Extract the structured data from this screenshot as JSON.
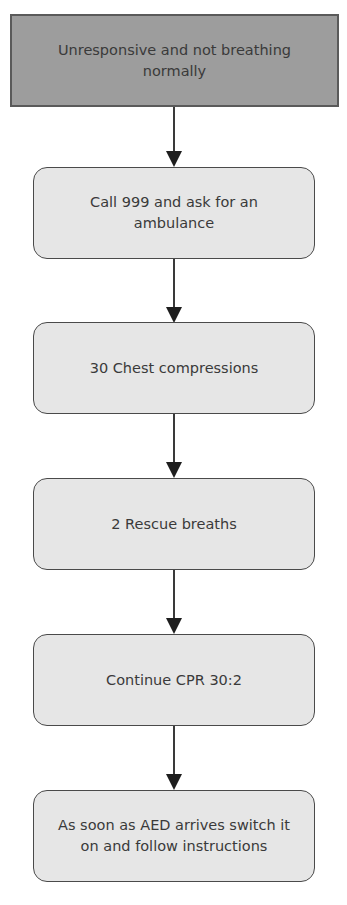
{
  "diagram": {
    "type": "flowchart",
    "direction": "top-to-bottom",
    "nodes": [
      {
        "id": "start",
        "label": "Unresponsive and not breathing normally",
        "shape": "rectangle",
        "fill": "#9d9d9d"
      },
      {
        "id": "call",
        "label": "Call 999 and ask for an ambulance",
        "shape": "rounded-rectangle",
        "fill": "#e6e6e6"
      },
      {
        "id": "compressions",
        "label": "30 Chest compressions",
        "shape": "rounded-rectangle",
        "fill": "#e6e6e6"
      },
      {
        "id": "breaths",
        "label": "2 Rescue breaths",
        "shape": "rounded-rectangle",
        "fill": "#e6e6e6"
      },
      {
        "id": "continue",
        "label": "Continue CPR 30:2",
        "shape": "rounded-rectangle",
        "fill": "#e6e6e6"
      },
      {
        "id": "aed",
        "label": "As soon as AED arrives switch it on and follow instructions",
        "shape": "rounded-rectangle",
        "fill": "#e6e6e6"
      }
    ],
    "edges": [
      {
        "from": "start",
        "to": "call"
      },
      {
        "from": "call",
        "to": "compressions"
      },
      {
        "from": "compressions",
        "to": "breaths"
      },
      {
        "from": "breaths",
        "to": "continue"
      },
      {
        "from": "continue",
        "to": "aed"
      }
    ]
  }
}
